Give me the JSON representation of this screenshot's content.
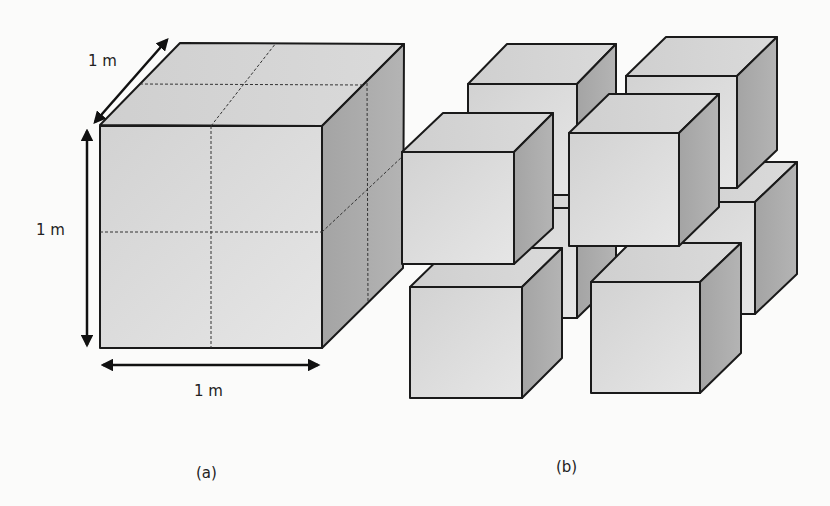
{
  "figure": {
    "panel_a": {
      "caption": "(a)",
      "depth_label": "1 m",
      "height_label": "1 m",
      "width_label": "1 m",
      "description": "Single 1 m cube subdivided into 8 smaller cubes by dashed lines"
    },
    "panel_b": {
      "caption": "(b)",
      "description": "Eight separated smaller cubes arranged in 2x2x2 configuration"
    }
  },
  "colors": {
    "front_face": "#dcdcdc",
    "top_face": "#d2d2d2",
    "side_face": "#a9a9a9",
    "outline": "#1a1a1a",
    "background": "#fbfbfa"
  }
}
